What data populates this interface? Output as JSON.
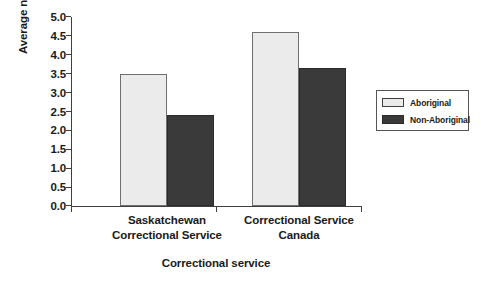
{
  "chart_data": {
    "type": "bar",
    "title": "",
    "subtitle": "",
    "xlabel": "Correctional service",
    "ylabel": "Average number of needs",
    "categories": [
      "Saskatchewan Correctional Service",
      "Correctional Service Canada"
    ],
    "category_lines": [
      [
        "Saskatchewan",
        "Correctional Service"
      ],
      [
        "Correctional Service",
        "Canada"
      ]
    ],
    "series": [
      {
        "name": "Aboriginal",
        "color": "#ebebeb",
        "values": [
          3.5,
          4.6
        ]
      },
      {
        "name": "Non-Aboriginal",
        "color": "#3a3a3a",
        "values": [
          2.4,
          3.65
        ]
      }
    ],
    "ylim": [
      0.0,
      5.0
    ],
    "ytick_step": 0.5,
    "yticks": [
      "5.0",
      "4.5",
      "4.0",
      "3.5",
      "3.0",
      "2.5",
      "2.0",
      "1.5",
      "1.0",
      "0.5",
      "0.0"
    ],
    "ytick_values": [
      5.0,
      4.5,
      4.0,
      3.5,
      3.0,
      2.5,
      2.0,
      1.5,
      1.0,
      0.5,
      0.0
    ],
    "grid": false,
    "legend_position": "right",
    "axis_color": "#3f3f3f",
    "background": "#ffffff"
  },
  "legend": {
    "entries": [
      {
        "label": "Aboriginal"
      },
      {
        "label": "Non-Aboriginal"
      }
    ]
  }
}
